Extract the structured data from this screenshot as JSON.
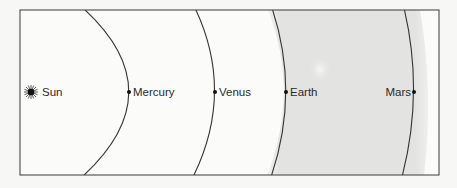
{
  "diagram": {
    "type": "orbit-diagram",
    "colors": {
      "background": "#f7f7f5",
      "box_fill": "#fbfbfa",
      "band_fill": "#e4e4e2",
      "line": "#333333",
      "text": "#2a2a2a"
    },
    "sun": {
      "label": "Sun",
      "icon": "sun-icon"
    },
    "planets": [
      {
        "name": "Mercury",
        "label": "Mercury",
        "label_side": "right"
      },
      {
        "name": "Venus",
        "label": "Venus",
        "label_side": "right"
      },
      {
        "name": "Earth",
        "label": "Earth",
        "label_side": "right"
      },
      {
        "name": "Mars",
        "label": "Mars",
        "label_side": "left"
      }
    ],
    "shaded_region": {
      "from": "Earth",
      "to": "Mars"
    }
  }
}
